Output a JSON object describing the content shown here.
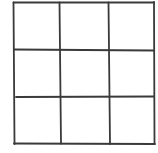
{
  "diagram": {
    "type": "grid",
    "rows": 3,
    "cols": 3,
    "style": "hand-drawn",
    "stroke_color": "#3a3a3a",
    "background": "#ffffff",
    "cells": [
      [
        "",
        "",
        ""
      ],
      [
        "",
        "",
        ""
      ],
      [
        "",
        "",
        ""
      ]
    ]
  }
}
